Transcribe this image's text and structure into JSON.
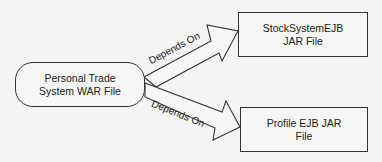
{
  "nodes": {
    "war": {
      "line1": "Personal Trade",
      "line2": "System WAR File"
    },
    "stock": {
      "line1": "StockSystemEJB",
      "line2": "JAR File"
    },
    "profile": {
      "line1": "Profile EJB JAR",
      "line2": "File"
    }
  },
  "edges": [
    {
      "from": "war",
      "to": "stock",
      "label": "Depends On"
    },
    {
      "from": "war",
      "to": "profile",
      "label": "Depends On"
    }
  ]
}
